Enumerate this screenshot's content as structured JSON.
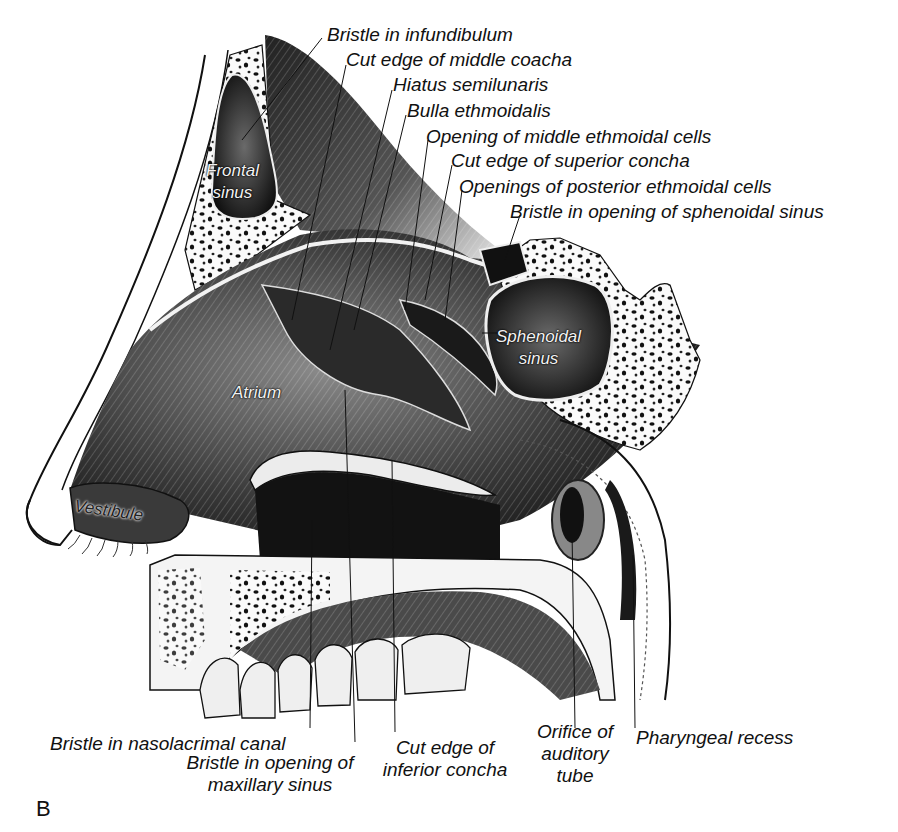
{
  "figure": {
    "panel_letter": "B"
  },
  "labels": {
    "top": [
      {
        "id": "bristle-infundibulum",
        "text": "Bristle in infundibulum"
      },
      {
        "id": "cut-edge-middle-concha",
        "text": "Cut edge of middle coacha"
      },
      {
        "id": "hiatus-semilunaris",
        "text": "Hiatus semilunaris"
      },
      {
        "id": "bulla-ethmoidalis",
        "text": "Bulla ethmoidalis"
      },
      {
        "id": "opening-middle-ethmoidal",
        "text": "Opening of middle ethmoidal cells"
      },
      {
        "id": "cut-edge-superior-concha",
        "text": "Cut edge of superior concha"
      },
      {
        "id": "openings-posterior-ethmoidal",
        "text": "Openings of posterior ethmoidal cells"
      },
      {
        "id": "bristle-sphenoidal",
        "text": "Bristle in opening of sphenoidal sinus"
      }
    ],
    "bottom": [
      {
        "id": "bristle-nasolacrimal",
        "text": "Bristle in nasolacrimal canal"
      },
      {
        "id": "bristle-maxillary",
        "text": "Bristle in opening of\nmaxillary sinus"
      },
      {
        "id": "cut-edge-inferior-concha",
        "text": "Cut edge of\ninferior concha"
      },
      {
        "id": "orifice-auditory-tube",
        "text": "Orifice of\nauditory\ntube"
      },
      {
        "id": "pharyngeal-recess",
        "text": "Pharyngeal recess"
      }
    ],
    "inside": [
      {
        "id": "frontal-sinus",
        "text": "Frontal\nsinus"
      },
      {
        "id": "sphenoidal-sinus",
        "text": "Sphenoidal\nsinus"
      },
      {
        "id": "atrium",
        "text": "Atrium"
      },
      {
        "id": "vestibule",
        "text": "Vestibule"
      }
    ]
  },
  "colors": {
    "ink": "#111111",
    "background": "#ffffff",
    "tissue_dark": "#1a1a1a",
    "tissue_mid": "#555555",
    "bone": "#f4f4f4"
  }
}
